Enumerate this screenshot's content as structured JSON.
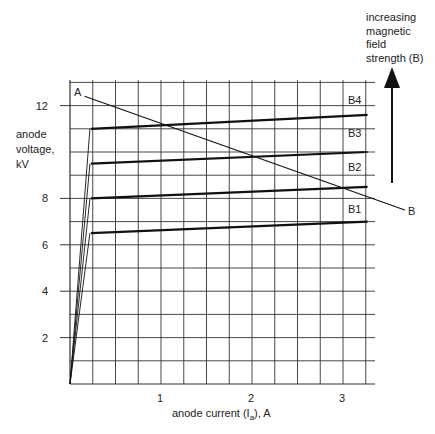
{
  "chart_data": {
    "type": "line",
    "title": "",
    "xlabel": "anode current (I_a), A",
    "ylabel": "anode voltage, kV",
    "xlim": [
      0,
      3.3
    ],
    "ylim": [
      0,
      13
    ],
    "x_ticks": [
      1,
      2,
      3
    ],
    "x_tick_labels": [
      "1",
      "2",
      "3"
    ],
    "y_ticks": [
      2,
      4,
      6,
      8,
      12
    ],
    "y_tick_labels": [
      "2",
      "4",
      "6",
      "8",
      "12"
    ],
    "grid": true,
    "grid_x_step": 0.25,
    "grid_y_step": 1,
    "series": [
      {
        "name": "B1",
        "x": [
          0,
          0.23,
          3.27
        ],
        "y": [
          0,
          6.5,
          7.0
        ]
      },
      {
        "name": "B2",
        "x": [
          0,
          0.23,
          3.27
        ],
        "y": [
          0,
          8.0,
          8.5
        ]
      },
      {
        "name": "B3",
        "x": [
          0,
          0.23,
          3.27
        ],
        "y": [
          0,
          9.5,
          10.0
        ]
      },
      {
        "name": "B4",
        "x": [
          0,
          0.23,
          3.27
        ],
        "y": [
          0,
          11.0,
          11.6
        ]
      }
    ],
    "load_line": {
      "name": "A–B",
      "start_label": "A",
      "end_label": "B",
      "x": [
        0.16,
        3.68
      ],
      "y": [
        12.4,
        7.5
      ]
    },
    "annotations": [
      {
        "text": "increasing magnetic field strength (B)",
        "arrow": "up"
      }
    ],
    "legend_position": "inline labels at right of curves"
  },
  "labels": {
    "cropped_top_text": "...magnetic field strength...",
    "y_axis_lines": [
      "anode",
      "voltage,",
      "kV"
    ],
    "x_axis": "anode current (I",
    "x_axis_sub": "a",
    "x_axis_suffix": "), A",
    "note_lines": [
      "increasing",
      "magnetic",
      "field",
      "strength (B)"
    ],
    "point_a": "A",
    "point_b": "B",
    "curve_labels": [
      "B1",
      "B2",
      "B3",
      "B4"
    ],
    "y_ticks": [
      "12",
      "8",
      "6",
      "4",
      "2"
    ],
    "x_ticks": [
      "1",
      "2",
      "3"
    ]
  },
  "colors": {
    "grid": "#333333",
    "curve": "#111111",
    "text": "#222222",
    "background": "#ffffff"
  }
}
